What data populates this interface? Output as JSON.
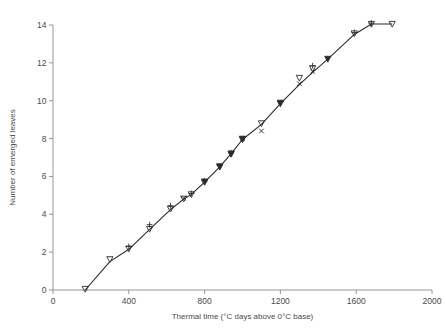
{
  "chart_data": {
    "type": "line",
    "title": "",
    "subtitle": "",
    "xlabel": "Thermal time (°C days above 0°C base)",
    "ylabel": "Number of emerged leaves",
    "xlim": [
      0,
      2000
    ],
    "ylim": [
      0,
      14
    ],
    "xticks": [
      0,
      400,
      800,
      1200,
      1600,
      2000
    ],
    "yticks": [
      0,
      2,
      4,
      6,
      8,
      10,
      12,
      14
    ],
    "xtick_labels": [
      "0",
      "400",
      "800",
      "1200",
      "1600",
      "2000"
    ],
    "ytick_labels": [
      "0",
      "2",
      "4",
      "6",
      "8",
      "10",
      "12",
      "14"
    ],
    "grid": false,
    "legend": "none",
    "fit_line": {
      "name": "fitted leaf emergence line",
      "x": [
        170,
        300,
        400,
        510,
        620,
        690,
        730,
        800,
        880,
        940,
        1000,
        1100,
        1200,
        1300,
        1370,
        1450,
        1590,
        1680,
        1790
      ],
      "y": [
        0.0,
        1.5,
        2.15,
        3.2,
        4.25,
        4.8,
        5.05,
        5.7,
        6.5,
        7.2,
        7.95,
        8.75,
        9.85,
        10.85,
        11.5,
        12.2,
        13.5,
        14.05,
        14.05
      ]
    },
    "series": [
      {
        "name": "open down triangle",
        "marker": "triangle-down-open",
        "points": [
          {
            "x": 170,
            "y": 0.05
          },
          {
            "x": 300,
            "y": 1.62
          },
          {
            "x": 400,
            "y": 2.18
          },
          {
            "x": 510,
            "y": 3.22
          },
          {
            "x": 620,
            "y": 4.28
          },
          {
            "x": 690,
            "y": 4.82
          },
          {
            "x": 730,
            "y": 5.05
          },
          {
            "x": 800,
            "y": 5.7
          },
          {
            "x": 880,
            "y": 6.5
          },
          {
            "x": 940,
            "y": 7.2
          },
          {
            "x": 1000,
            "y": 7.95
          },
          {
            "x": 1100,
            "y": 8.8
          },
          {
            "x": 1200,
            "y": 9.85
          },
          {
            "x": 1300,
            "y": 11.2
          },
          {
            "x": 1370,
            "y": 11.7
          },
          {
            "x": 1590,
            "y": 13.55
          },
          {
            "x": 1680,
            "y": 14.05
          },
          {
            "x": 1790,
            "y": 14.05
          }
        ]
      },
      {
        "name": "plus",
        "marker": "plus",
        "points": [
          {
            "x": 400,
            "y": 2.3
          },
          {
            "x": 510,
            "y": 3.45
          },
          {
            "x": 620,
            "y": 4.45
          },
          {
            "x": 730,
            "y": 5.1
          },
          {
            "x": 800,
            "y": 5.75
          },
          {
            "x": 940,
            "y": 7.25
          },
          {
            "x": 1370,
            "y": 11.85
          },
          {
            "x": 1590,
            "y": 13.6
          },
          {
            "x": 1680,
            "y": 14.1
          }
        ]
      },
      {
        "name": "cross",
        "marker": "cross",
        "points": [
          {
            "x": 690,
            "y": 4.85
          },
          {
            "x": 1000,
            "y": 8.0
          },
          {
            "x": 1100,
            "y": 8.4
          },
          {
            "x": 1300,
            "y": 10.9
          },
          {
            "x": 1370,
            "y": 11.55
          }
        ]
      },
      {
        "name": "filled triangle",
        "marker": "triangle-filled",
        "points": [
          {
            "x": 800,
            "y": 5.72
          },
          {
            "x": 880,
            "y": 6.52
          },
          {
            "x": 940,
            "y": 7.18
          },
          {
            "x": 1000,
            "y": 7.98
          },
          {
            "x": 1200,
            "y": 9.88
          },
          {
            "x": 1450,
            "y": 12.2
          }
        ]
      }
    ]
  },
  "axes": {
    "x_axis_name": "thermal-time-axis",
    "y_axis_name": "emerged-leaves-axis"
  }
}
